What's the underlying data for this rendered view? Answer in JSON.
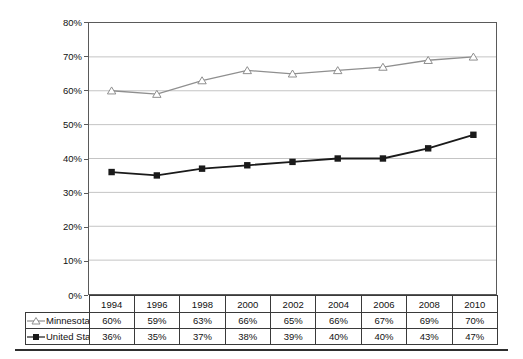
{
  "chart_data": {
    "type": "line",
    "categories": [
      "1994",
      "1996",
      "1998",
      "2000",
      "2002",
      "2004",
      "2006",
      "2008",
      "2010"
    ],
    "series": [
      {
        "name": "Minnesota",
        "values": [
          60,
          59,
          63,
          66,
          65,
          66,
          67,
          69,
          70
        ],
        "color": "#8f8f8f",
        "marker": "triangle-open",
        "line_width": 1.3
      },
      {
        "name": "United States",
        "values": [
          36,
          35,
          37,
          38,
          39,
          40,
          40,
          43,
          47
        ],
        "color": "#1a1a1a",
        "marker": "square-filled",
        "line_width": 1.8
      }
    ],
    "title": "",
    "xlabel": "",
    "ylabel": "",
    "ylim": [
      0,
      80
    ],
    "ytick_step": 10,
    "ytick_labels": [
      "0%",
      "10%",
      "20%",
      "30%",
      "40%",
      "50%",
      "60%",
      "70%",
      "80%"
    ],
    "grid": true,
    "gridline_color": "#c4c4c4",
    "legend_position": "table-left",
    "value_suffix": "%"
  },
  "table": {
    "header": [
      "1994",
      "1996",
      "1998",
      "2000",
      "2002",
      "2004",
      "2006",
      "2008",
      "2010"
    ],
    "rows": [
      {
        "label": "Minnesota",
        "values": [
          "60%",
          "59%",
          "63%",
          "66%",
          "65%",
          "66%",
          "67%",
          "69%",
          "70%"
        ]
      },
      {
        "label": "United States",
        "values": [
          "36%",
          "35%",
          "37%",
          "38%",
          "39%",
          "40%",
          "40%",
          "43%",
          "47%"
        ]
      }
    ]
  }
}
